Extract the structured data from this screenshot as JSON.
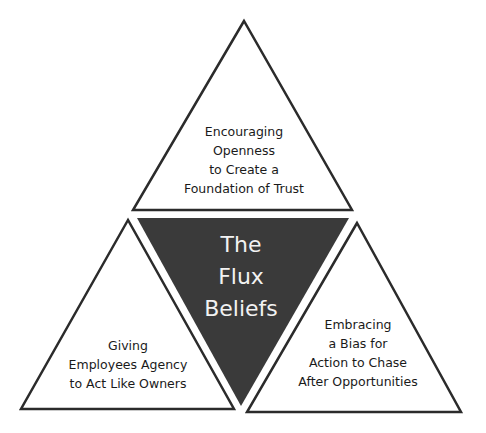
{
  "diagram": {
    "colors": {
      "dark_fill": "#3a3a3a",
      "outline": "#2b2b2b",
      "background": "#ffffff"
    },
    "center": {
      "lines": [
        "The",
        "Flux",
        "Beliefs"
      ]
    },
    "top": {
      "lines": [
        "Encouraging",
        "Openness",
        "to Create a",
        "Foundation of Trust"
      ]
    },
    "left": {
      "lines": [
        "Giving",
        "Employees Agency",
        "to Act Like Owners"
      ]
    },
    "right": {
      "lines": [
        "Embracing",
        "a Bias for",
        "Action to Chase",
        "After Opportunities"
      ]
    }
  }
}
